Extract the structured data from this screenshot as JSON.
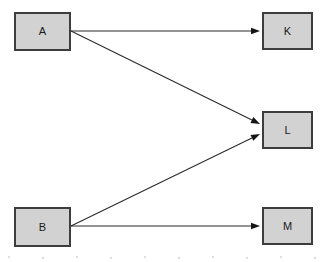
{
  "diagram": {
    "type": "directed-graph",
    "title": "",
    "background_color": "#ffffff",
    "node_fill_color": "#d2d2d2",
    "node_border_color": "#3d3d3d",
    "edge_color": "#2b2b2b",
    "nodes": [
      {
        "id": "A",
        "label": "A",
        "x": 14,
        "y": 12,
        "width": 57,
        "height": 39,
        "column": "left"
      },
      {
        "id": "B",
        "label": "B",
        "x": 14,
        "y": 207,
        "width": 57,
        "height": 40,
        "column": "left"
      },
      {
        "id": "K",
        "label": "K",
        "x": 262,
        "y": 12,
        "width": 51,
        "height": 38,
        "column": "right"
      },
      {
        "id": "L",
        "label": "L",
        "x": 262,
        "y": 111,
        "width": 51,
        "height": 38,
        "column": "right"
      },
      {
        "id": "M",
        "label": "M",
        "x": 262,
        "y": 207,
        "width": 51,
        "height": 38,
        "column": "right"
      }
    ],
    "edges": [
      {
        "id": "a-to-k",
        "from": "A",
        "to": "K",
        "label": "",
        "x1": 71,
        "y1": 31,
        "x2": 260,
        "y2": 31,
        "directed": true
      },
      {
        "id": "a-to-l",
        "from": "A",
        "to": "L",
        "label": "",
        "x1": 71,
        "y1": 31,
        "x2": 260,
        "y2": 124,
        "directed": true
      },
      {
        "id": "b-to-l",
        "from": "B",
        "to": "L",
        "label": "",
        "x1": 71,
        "y1": 226,
        "x2": 260,
        "y2": 134,
        "directed": true
      },
      {
        "id": "b-to-m",
        "from": "B",
        "to": "M",
        "label": "",
        "x1": 71,
        "y1": 226,
        "x2": 260,
        "y2": 226,
        "directed": true
      }
    ],
    "specks": [
      {
        "x": 8,
        "y": 256
      },
      {
        "x": 42,
        "y": 257
      },
      {
        "x": 76,
        "y": 256
      },
      {
        "x": 110,
        "y": 257
      },
      {
        "x": 144,
        "y": 256
      },
      {
        "x": 178,
        "y": 257
      },
      {
        "x": 212,
        "y": 256
      },
      {
        "x": 246,
        "y": 257
      },
      {
        "x": 280,
        "y": 256
      },
      {
        "x": 314,
        "y": 257
      }
    ]
  }
}
